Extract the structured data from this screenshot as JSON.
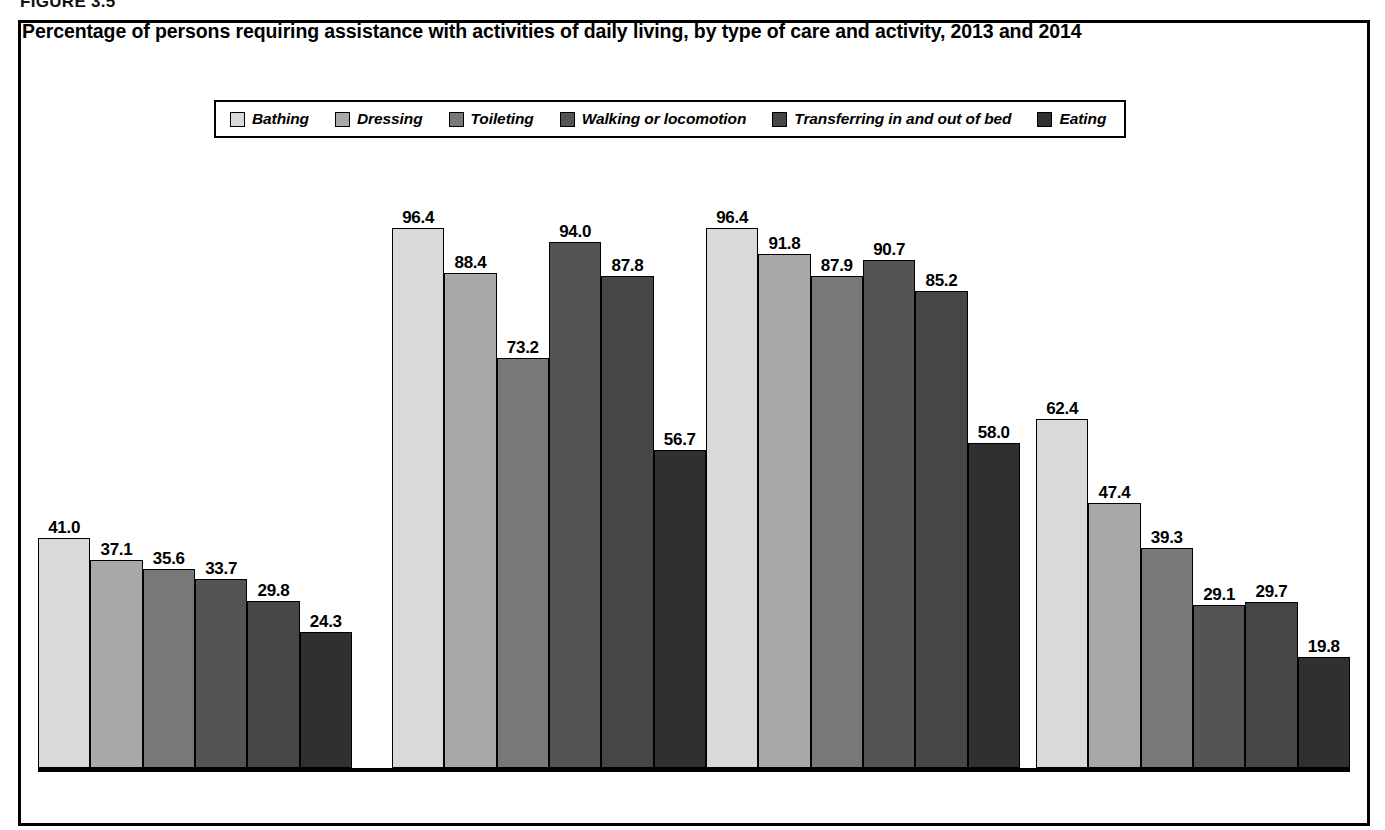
{
  "figure": {
    "number_label": "FIGURE 3.5",
    "title": "Percentage of persons requiring assistance with activities of daily living, by type of care and activity, 2013 and 2014"
  },
  "legend": {
    "items": [
      {
        "label": "Bathing",
        "color": "#d9d9d9"
      },
      {
        "label": "Dressing",
        "color": "#a8a8a8"
      },
      {
        "label": "Toileting",
        "color": "#787878"
      },
      {
        "label": "Walking or locomotion",
        "color": "#545454"
      },
      {
        "label": "Transferring in and out of bed",
        "color": "#464646"
      },
      {
        "label": "Eating",
        "color": "#303030"
      }
    ]
  },
  "chart_data": {
    "type": "bar",
    "title": "Percentage of persons requiring assistance with activities of daily living, by type of care and activity, 2013 and 2014",
    "xlabel": "",
    "ylabel": "",
    "ylim": [
      0,
      100
    ],
    "grid": false,
    "legend_position": "top-center",
    "categories": [
      "Adult day\nservices center",
      "Home health\nagency",
      "Nursing home",
      "Residential care\ncommunity"
    ],
    "category_lines": [
      [
        "Adult day",
        "services center"
      ],
      [
        "Home health",
        "agency"
      ],
      [
        "Nursing home",
        ""
      ],
      [
        "Residential care",
        "community"
      ]
    ],
    "series": [
      {
        "name": "Bathing",
        "color": "#d9d9d9",
        "values": [
          41.0,
          96.4,
          96.4,
          62.4
        ]
      },
      {
        "name": "Dressing",
        "color": "#a8a8a8",
        "values": [
          37.1,
          88.4,
          91.8,
          47.4
        ]
      },
      {
        "name": "Toileting",
        "color": "#787878",
        "values": [
          35.6,
          73.2,
          87.9,
          39.3
        ]
      },
      {
        "name": "Walking or locomotion",
        "color": "#545454",
        "values": [
          33.7,
          94.0,
          90.7,
          29.1
        ]
      },
      {
        "name": "Transferring in and out of bed",
        "color": "#464646",
        "values": [
          29.8,
          87.8,
          85.2,
          29.7
        ]
      },
      {
        "name": "Eating",
        "color": "#303030",
        "values": [
          24.3,
          56.7,
          58.0,
          19.8
        ]
      }
    ],
    "value_labels": [
      [
        "41.0",
        "37.1",
        "35.6",
        "33.7",
        "29.8",
        "24.3"
      ],
      [
        "96.4",
        "88.4",
        "73.2",
        "94.0",
        "87.8",
        "56.7"
      ],
      [
        "96.4",
        "91.8",
        "87.9",
        "90.7",
        "85.2",
        "58.0"
      ],
      [
        "62.4",
        "47.4",
        "39.3",
        "29.1",
        "29.7",
        "19.8"
      ]
    ]
  }
}
